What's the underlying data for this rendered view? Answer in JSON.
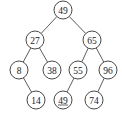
{
  "diagram": {
    "type": "binary-search-tree",
    "node_radius": 9,
    "colors": {
      "stroke": "#333333",
      "fill": "#ffffff",
      "text": "#222222"
    },
    "nodes": [
      {
        "id": "n49",
        "label": "49",
        "x": 63,
        "y": 10,
        "underlined": false
      },
      {
        "id": "n27",
        "label": "27",
        "x": 35,
        "y": 40,
        "underlined": false
      },
      {
        "id": "n65",
        "label": "65",
        "x": 92,
        "y": 40,
        "underlined": false
      },
      {
        "id": "n8",
        "label": "8",
        "x": 19,
        "y": 70,
        "underlined": false
      },
      {
        "id": "n38",
        "label": "38",
        "x": 52,
        "y": 70,
        "underlined": false
      },
      {
        "id": "n55",
        "label": "55",
        "x": 78,
        "y": 70,
        "underlined": false
      },
      {
        "id": "n96",
        "label": "96",
        "x": 108,
        "y": 70,
        "underlined": false
      },
      {
        "id": "n14",
        "label": "14",
        "x": 36,
        "y": 100,
        "underlined": false
      },
      {
        "id": "n49b",
        "label": "49",
        "x": 63,
        "y": 100,
        "underlined": true
      },
      {
        "id": "n74",
        "label": "74",
        "x": 94,
        "y": 100,
        "underlined": false
      }
    ],
    "edges": [
      {
        "from": "n49",
        "to": "n27"
      },
      {
        "from": "n49",
        "to": "n65"
      },
      {
        "from": "n27",
        "to": "n8"
      },
      {
        "from": "n27",
        "to": "n38"
      },
      {
        "from": "n65",
        "to": "n55"
      },
      {
        "from": "n65",
        "to": "n96"
      },
      {
        "from": "n8",
        "to": "n14"
      },
      {
        "from": "n55",
        "to": "n49b"
      },
      {
        "from": "n96",
        "to": "n74"
      }
    ]
  }
}
